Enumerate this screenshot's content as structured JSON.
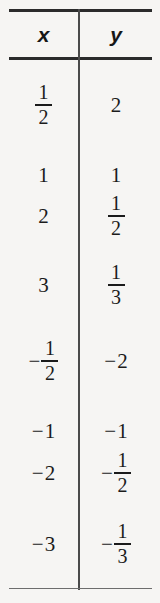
{
  "figure": {
    "kind": "math-table",
    "background_color": "#f6f5f3",
    "rule_color": "#2b2b2b",
    "bottom_rule_color": "#6d6d6d",
    "divider_color": "#4a4a4a",
    "text_color": "#1b1b1b"
  },
  "table": {
    "columns": [
      {
        "key": "x",
        "label": "x"
      },
      {
        "key": "y",
        "label": "y"
      }
    ],
    "rows": [
      {
        "top": 22,
        "x": {
          "sign": "",
          "whole": "",
          "numerator": "1",
          "denominator": "2",
          "is_fraction": true,
          "text": "1/2"
        },
        "y": {
          "sign": "",
          "whole": "2",
          "numerator": "",
          "denominator": "",
          "is_fraction": false,
          "text": "2"
        }
      },
      {
        "top": 92,
        "x": {
          "sign": "",
          "whole": "1",
          "numerator": "",
          "denominator": "",
          "is_fraction": false,
          "text": "1"
        },
        "y": {
          "sign": "",
          "whole": "1",
          "numerator": "",
          "denominator": "",
          "is_fraction": false,
          "text": "1"
        }
      },
      {
        "top": 133,
        "x": {
          "sign": "",
          "whole": "2",
          "numerator": "",
          "denominator": "",
          "is_fraction": false,
          "text": "2"
        },
        "y": {
          "sign": "",
          "whole": "",
          "numerator": "1",
          "denominator": "2",
          "is_fraction": true,
          "text": "1/2"
        }
      },
      {
        "top": 202,
        "x": {
          "sign": "",
          "whole": "3",
          "numerator": "",
          "denominator": "",
          "is_fraction": false,
          "text": "3"
        },
        "y": {
          "sign": "",
          "whole": "",
          "numerator": "1",
          "denominator": "3",
          "is_fraction": true,
          "text": "1/3"
        }
      },
      {
        "top": 278,
        "x": {
          "sign": "−",
          "whole": "",
          "numerator": "1",
          "denominator": "2",
          "is_fraction": true,
          "text": "-1/2"
        },
        "y": {
          "sign": "−",
          "whole": "2",
          "numerator": "",
          "denominator": "",
          "is_fraction": false,
          "text": "-2"
        }
      },
      {
        "top": 348,
        "x": {
          "sign": "−",
          "whole": "1",
          "numerator": "",
          "denominator": "",
          "is_fraction": false,
          "text": "-1"
        },
        "y": {
          "sign": "−",
          "whole": "1",
          "numerator": "",
          "denominator": "",
          "is_fraction": false,
          "text": "-1"
        }
      },
      {
        "top": 390,
        "x": {
          "sign": "−",
          "whole": "2",
          "numerator": "",
          "denominator": "",
          "is_fraction": false,
          "text": "-2"
        },
        "y": {
          "sign": "−",
          "whole": "",
          "numerator": "1",
          "denominator": "2",
          "is_fraction": true,
          "text": "-1/2"
        }
      },
      {
        "top": 461,
        "x": {
          "sign": "−",
          "whole": "3",
          "numerator": "",
          "denominator": "",
          "is_fraction": false,
          "text": "-3"
        },
        "y": {
          "sign": "−",
          "whole": "",
          "numerator": "1",
          "denominator": "3",
          "is_fraction": true,
          "text": "-1/3"
        }
      }
    ]
  }
}
